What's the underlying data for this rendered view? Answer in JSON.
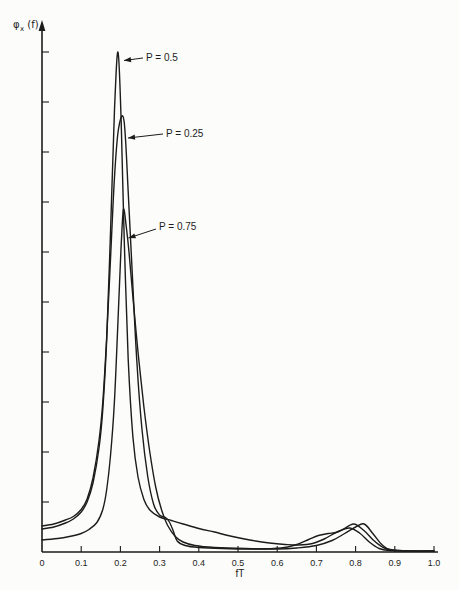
{
  "figure": {
    "background": "#fcfcfa",
    "line_color": "#1c1c1c"
  },
  "chart_data": {
    "type": "line",
    "title": "",
    "xlabel": "fT",
    "ylabel": "φx (f)",
    "ylabel_phi": "φ",
    "ylabel_sub": "x",
    "ylabel_rest": "(f)",
    "xlim": [
      0,
      1.0
    ],
    "x_tick_labels": [
      "0",
      "0.1",
      "0.2",
      "0.3",
      "0.4",
      "0.5",
      "0.6",
      "0.7",
      "0.8",
      "0.9",
      "1.0"
    ],
    "y_axis": {
      "tick_count": 10,
      "tick_labels_visible": false
    },
    "legend": "none",
    "grid": false,
    "series": [
      {
        "name": "P = 0.5",
        "peak": {
          "fT": 0.194,
          "value": 10.0
        },
        "points": [
          [
            0,
            0.46
          ],
          [
            0.03,
            0.5
          ],
          [
            0.06,
            0.58
          ],
          [
            0.08,
            0.66
          ],
          [
            0.1,
            0.8
          ],
          [
            0.115,
            1.0
          ],
          [
            0.13,
            1.38
          ],
          [
            0.145,
            2.05
          ],
          [
            0.155,
            2.85
          ],
          [
            0.165,
            4.25
          ],
          [
            0.175,
            6.45
          ],
          [
            0.185,
            8.85
          ],
          [
            0.194,
            10.0
          ],
          [
            0.202,
            8.6
          ],
          [
            0.21,
            6.2
          ],
          [
            0.22,
            3.85
          ],
          [
            0.232,
            2.3
          ],
          [
            0.245,
            1.5
          ],
          [
            0.26,
            1.05
          ],
          [
            0.275,
            0.84
          ],
          [
            0.3,
            0.7
          ],
          [
            0.33,
            0.63
          ],
          [
            0.36,
            0.56
          ],
          [
            0.4,
            0.47
          ],
          [
            0.44,
            0.4
          ],
          [
            0.48,
            0.32
          ],
          [
            0.53,
            0.24
          ],
          [
            0.58,
            0.18
          ],
          [
            0.62,
            0.15
          ],
          [
            0.655,
            0.14
          ],
          [
            0.69,
            0.17
          ],
          [
            0.72,
            0.26
          ],
          [
            0.755,
            0.41
          ],
          [
            0.785,
            0.48
          ],
          [
            0.81,
            0.38
          ],
          [
            0.835,
            0.2
          ],
          [
            0.86,
            0.07
          ],
          [
            0.885,
            0.03
          ],
          [
            0.94,
            0.02
          ],
          [
            1.0,
            0.02
          ]
        ]
      },
      {
        "name": "P = 0.25",
        "peak": {
          "fT": 0.209,
          "value": 8.64
        },
        "points": [
          [
            0,
            0.52
          ],
          [
            0.03,
            0.56
          ],
          [
            0.06,
            0.64
          ],
          [
            0.08,
            0.71
          ],
          [
            0.1,
            0.85
          ],
          [
            0.115,
            1.06
          ],
          [
            0.13,
            1.48
          ],
          [
            0.145,
            2.2
          ],
          [
            0.155,
            3.0
          ],
          [
            0.165,
            4.3
          ],
          [
            0.175,
            5.9
          ],
          [
            0.185,
            7.5
          ],
          [
            0.195,
            8.45
          ],
          [
            0.209,
            8.64
          ],
          [
            0.22,
            7.2
          ],
          [
            0.23,
            5.6
          ],
          [
            0.242,
            3.8
          ],
          [
            0.255,
            2.45
          ],
          [
            0.27,
            1.5
          ],
          [
            0.285,
            0.95
          ],
          [
            0.3,
            0.74
          ],
          [
            0.315,
            0.69
          ],
          [
            0.325,
            0.6
          ],
          [
            0.335,
            0.42
          ],
          [
            0.345,
            0.22
          ],
          [
            0.365,
            0.13
          ],
          [
            0.4,
            0.09
          ],
          [
            0.46,
            0.07
          ],
          [
            0.54,
            0.06
          ],
          [
            0.61,
            0.08
          ],
          [
            0.65,
            0.15
          ],
          [
            0.68,
            0.25
          ],
          [
            0.705,
            0.33
          ],
          [
            0.73,
            0.37
          ],
          [
            0.75,
            0.39
          ],
          [
            0.768,
            0.45
          ],
          [
            0.795,
            0.56
          ],
          [
            0.82,
            0.44
          ],
          [
            0.845,
            0.24
          ],
          [
            0.868,
            0.1
          ],
          [
            0.89,
            0.04
          ],
          [
            0.94,
            0.02
          ],
          [
            1.0,
            0.02
          ]
        ]
      },
      {
        "name": "P = 0.75",
        "peak": {
          "fT": 0.208,
          "value": 6.86
        },
        "points": [
          [
            0,
            0.24
          ],
          [
            0.04,
            0.27
          ],
          [
            0.07,
            0.31
          ],
          [
            0.1,
            0.37
          ],
          [
            0.12,
            0.45
          ],
          [
            0.14,
            0.59
          ],
          [
            0.155,
            0.85
          ],
          [
            0.165,
            1.25
          ],
          [
            0.175,
            1.95
          ],
          [
            0.184,
            2.9
          ],
          [
            0.191,
            4.1
          ],
          [
            0.198,
            5.4
          ],
          [
            0.203,
            6.3
          ],
          [
            0.208,
            6.86
          ],
          [
            0.215,
            6.5
          ],
          [
            0.222,
            6.0
          ],
          [
            0.232,
            5.1
          ],
          [
            0.245,
            4.0
          ],
          [
            0.26,
            2.9
          ],
          [
            0.275,
            2.0
          ],
          [
            0.29,
            1.3
          ],
          [
            0.305,
            0.84
          ],
          [
            0.32,
            0.54
          ],
          [
            0.34,
            0.31
          ],
          [
            0.36,
            0.2
          ],
          [
            0.39,
            0.13
          ],
          [
            0.44,
            0.09
          ],
          [
            0.52,
            0.07
          ],
          [
            0.6,
            0.06
          ],
          [
            0.65,
            0.08
          ],
          [
            0.7,
            0.13
          ],
          [
            0.74,
            0.23
          ],
          [
            0.77,
            0.36
          ],
          [
            0.8,
            0.5
          ],
          [
            0.822,
            0.56
          ],
          [
            0.845,
            0.36
          ],
          [
            0.868,
            0.14
          ],
          [
            0.888,
            0.05
          ],
          [
            0.94,
            0.02
          ],
          [
            1.0,
            0.02
          ]
        ]
      }
    ],
    "annotations": [
      {
        "label": "P = 0.5",
        "text_x": 146,
        "text_y": 58,
        "line": [
          143,
          58,
          124,
          60.5
        ]
      },
      {
        "label": "P = 0.25",
        "text_x": 166,
        "text_y": 134,
        "line": [
          163,
          134,
          128,
          138
        ]
      },
      {
        "label": "P = 0.75",
        "text_x": 159,
        "text_y": 227,
        "line": [
          156,
          229,
          128.5,
          238
        ]
      }
    ]
  }
}
